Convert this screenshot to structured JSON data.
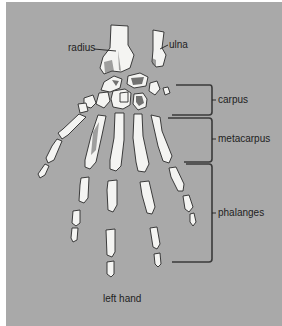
{
  "diagram": {
    "title": "left hand",
    "background_color": "#a9a9a9",
    "labels": {
      "radius": "radius",
      "ulna": "ulna",
      "carpus": "carpus",
      "metacarpus": "metacarpus",
      "phalanges": "phalanges"
    },
    "caption": "left hand"
  }
}
